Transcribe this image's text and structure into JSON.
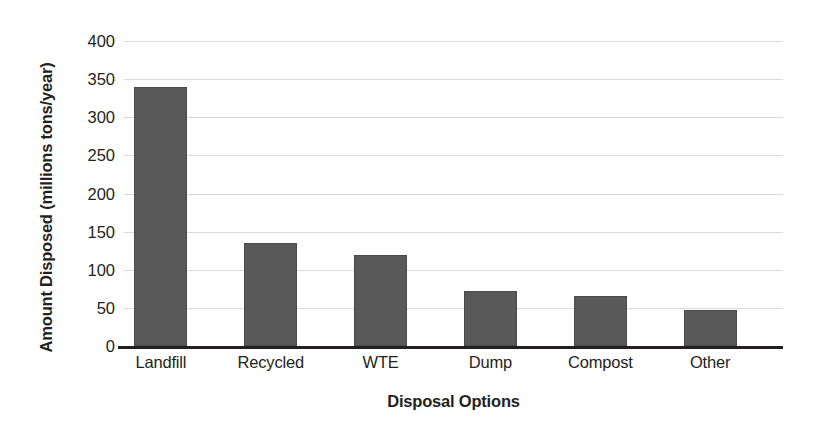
{
  "chart_data": {
    "type": "bar",
    "title": "",
    "xlabel": "Disposal Options",
    "ylabel": "Amount Disposed (millions tons/year)",
    "ylabel_bold_part": "Amount Disposed",
    "ylabel_regular_part": "(millions tons/year)",
    "categories": [
      "Landfill",
      "Recycled",
      "WTE",
      "Dump",
      "Compost",
      "Other"
    ],
    "values": [
      340,
      135,
      120,
      72,
      66,
      47
    ],
    "ylim": [
      0,
      400
    ],
    "ytick_step": 50,
    "yticks": [
      "400",
      "350",
      "300",
      "250",
      "200",
      "150",
      "100",
      "50",
      "0"
    ],
    "ytick_values": [
      400,
      350,
      300,
      250,
      200,
      150,
      100,
      50,
      0
    ],
    "grid": true,
    "legend": "none",
    "bar_color": "#595959",
    "grid_color": "#d9d9d9",
    "axis_color": "#231f20",
    "background_color": "#ffffff"
  }
}
